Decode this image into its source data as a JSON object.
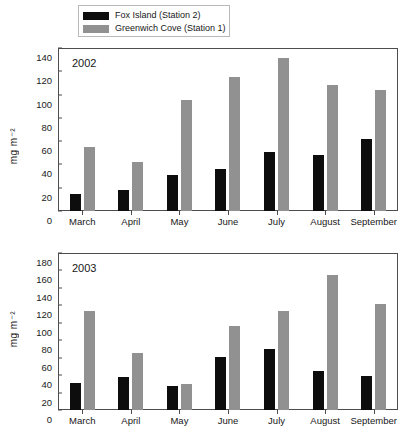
{
  "legend": {
    "items": [
      {
        "label": "Fox Island (Station 2)",
        "color": "#0d0d0d",
        "key": "fox"
      },
      {
        "label": "Greenwich Cove (Station 1)",
        "color": "#919191",
        "key": "gc"
      }
    ]
  },
  "chart_data": [
    {
      "type": "bar",
      "title": "2002",
      "xlabel": "",
      "ylabel": "mg m-2",
      "ylabel_display": "mg m⁻²",
      "ylim": [
        0,
        140
      ],
      "yticks": [
        0,
        20,
        40,
        60,
        80,
        100,
        120,
        140
      ],
      "grid": false,
      "legend_position": "top",
      "categories": [
        "March",
        "April",
        "May",
        "June",
        "July",
        "August",
        "September"
      ],
      "series": [
        {
          "name": "Fox Island (Station 2)",
          "color": "#0d0d0d",
          "values": [
            15,
            18,
            31,
            36,
            51,
            48,
            62
          ]
        },
        {
          "name": "Greenwich Cove (Station 1)",
          "color": "#919191",
          "values": [
            55,
            42,
            95,
            115,
            131,
            108,
            104
          ]
        }
      ]
    },
    {
      "type": "bar",
      "title": "2003",
      "xlabel": "",
      "ylabel": "mg m-2",
      "ylabel_display": "mg m⁻²",
      "ylim": [
        0,
        180
      ],
      "yticks": [
        0,
        20,
        40,
        60,
        80,
        100,
        120,
        140,
        160,
        180
      ],
      "grid": false,
      "legend_position": "top",
      "categories": [
        "March",
        "April",
        "May",
        "June",
        "July",
        "August",
        "September"
      ],
      "series": [
        {
          "name": "Fox Island (Station 2)",
          "color": "#0d0d0d",
          "values": [
            31,
            38,
            28,
            61,
            70,
            45,
            39
          ]
        },
        {
          "name": "Greenwich Cove (Station 1)",
          "color": "#919191",
          "values": [
            113,
            65,
            30,
            96,
            113,
            155,
            121
          ]
        }
      ]
    }
  ]
}
